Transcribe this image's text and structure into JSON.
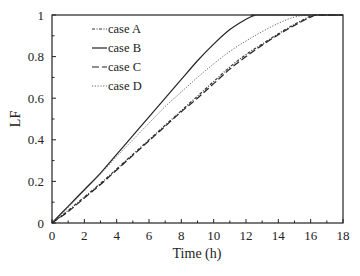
{
  "chart_data": {
    "type": "line",
    "title": "",
    "xlabel": "Time (h)",
    "ylabel": "LF",
    "xlim": [
      0,
      18
    ],
    "ylim": [
      0,
      1
    ],
    "xticks": [
      0,
      2,
      4,
      6,
      8,
      10,
      12,
      14,
      16,
      18
    ],
    "xtick_labels": [
      "0",
      "2",
      "4",
      "6",
      "8",
      "10",
      "12",
      "14",
      "16",
      "18"
    ],
    "yticks": [
      0,
      0.2,
      0.4,
      0.6,
      0.8,
      1
    ],
    "ytick_labels": [
      "0",
      "0.2",
      "0.4",
      "0.6",
      "0.8",
      "1"
    ],
    "grid": false,
    "legend_position": "top-left",
    "series": [
      {
        "name": "case A",
        "style": "dotted-dash",
        "color": "#333333",
        "x": [
          0,
          1,
          2,
          3,
          4,
          5,
          6,
          7,
          8,
          9,
          10,
          11,
          12,
          13,
          14,
          15,
          16,
          16.3,
          18
        ],
        "y": [
          0,
          0.06,
          0.125,
          0.19,
          0.26,
          0.33,
          0.4,
          0.47,
          0.54,
          0.61,
          0.68,
          0.75,
          0.81,
          0.86,
          0.91,
          0.955,
          0.995,
          1,
          1
        ]
      },
      {
        "name": "case B",
        "style": "solid",
        "color": "#222222",
        "x": [
          0,
          1,
          2,
          3,
          4,
          5,
          6,
          7,
          8,
          9,
          10,
          11,
          12,
          12.5,
          12.8,
          18
        ],
        "y": [
          0,
          0.08,
          0.16,
          0.24,
          0.33,
          0.42,
          0.51,
          0.6,
          0.69,
          0.78,
          0.86,
          0.93,
          0.98,
          0.997,
          1,
          1
        ]
      },
      {
        "name": "case C",
        "style": "dashed",
        "color": "#222222",
        "x": [
          0,
          1,
          2,
          3,
          4,
          5,
          6,
          7,
          8,
          9,
          10,
          11,
          12,
          13,
          14,
          15,
          16,
          16.5,
          18
        ],
        "y": [
          0,
          0.055,
          0.12,
          0.185,
          0.255,
          0.325,
          0.395,
          0.465,
          0.535,
          0.6,
          0.67,
          0.74,
          0.8,
          0.855,
          0.905,
          0.95,
          0.99,
          1,
          1
        ]
      },
      {
        "name": "case D",
        "style": "dotted",
        "color": "#555555",
        "x": [
          0,
          1,
          2,
          3,
          4,
          5,
          6,
          7,
          8,
          9,
          10,
          11,
          12,
          13,
          14,
          15,
          16,
          18
        ],
        "y": [
          0,
          0.075,
          0.155,
          0.235,
          0.32,
          0.4,
          0.48,
          0.56,
          0.63,
          0.7,
          0.765,
          0.825,
          0.875,
          0.92,
          0.96,
          0.99,
          1,
          1
        ]
      }
    ]
  }
}
